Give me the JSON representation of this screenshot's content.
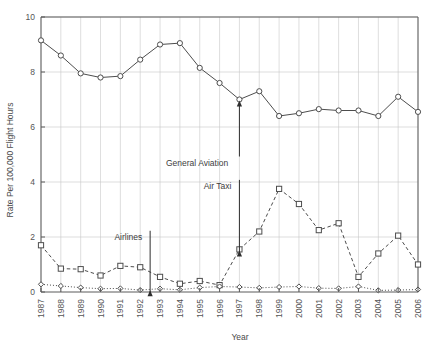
{
  "chart_data": {
    "type": "line",
    "title": "",
    "xlabel": "Year",
    "ylabel": "Rate Per 100,000 Flight Hours",
    "x": [
      1987,
      1988,
      1989,
      1990,
      1991,
      1992,
      1993,
      1994,
      1995,
      1996,
      1997,
      1998,
      1999,
      2000,
      2001,
      2002,
      2003,
      2004,
      2005,
      2006
    ],
    "categories": [
      "1987",
      "1988",
      "1989",
      "1990",
      "1991",
      "1992",
      "1993",
      "1994",
      "1995",
      "1996",
      "1997",
      "1998",
      "1999",
      "2000",
      "2001",
      "2002",
      "2003",
      "2004",
      "2005",
      "2006"
    ],
    "xlim": [
      1987,
      2006
    ],
    "ylim": [
      0,
      10
    ],
    "yticks": [
      0,
      2,
      4,
      6,
      8,
      10
    ],
    "ytick_labels": [
      "0",
      "2",
      "4",
      "6",
      "8",
      "10"
    ],
    "grid": true,
    "legend": "none",
    "series": [
      {
        "name": "General Aviation",
        "marker": "circle",
        "linestyle": "solid",
        "color": "#4d4d4d",
        "values": [
          9.15,
          8.6,
          7.95,
          7.8,
          7.85,
          8.45,
          9.0,
          9.05,
          8.15,
          7.6,
          7.0,
          7.3,
          6.4,
          6.5,
          6.65,
          6.6,
          6.6,
          6.4,
          7.1,
          6.55
        ]
      },
      {
        "name": "Air Taxi",
        "marker": "square",
        "linestyle": "dashed",
        "color": "#4d4d4d",
        "values": [
          1.7,
          0.85,
          0.83,
          0.6,
          0.95,
          0.9,
          0.55,
          0.3,
          0.4,
          0.25,
          1.55,
          2.2,
          3.75,
          3.2,
          2.25,
          2.5,
          0.55,
          1.4,
          2.05,
          1.0
        ]
      },
      {
        "name": "Airlines",
        "marker": "diamond",
        "linestyle": "dotted",
        "color": "#4d4d4d",
        "values": [
          0.28,
          0.22,
          0.16,
          0.12,
          0.13,
          0.07,
          0.12,
          0.08,
          0.16,
          0.2,
          0.18,
          0.15,
          0.18,
          0.2,
          0.14,
          0.13,
          0.2,
          0.06,
          0.07,
          0.09
        ]
      }
    ],
    "annotations": [
      {
        "label": "General Aviation",
        "target_x": 1997,
        "target_y": 7.0,
        "text_x": 1993.3,
        "text_y": 4.6
      },
      {
        "label": "Air Taxi",
        "target_x": 1997,
        "target_y": 1.55,
        "text_x": 1995.2,
        "text_y": 3.75
      },
      {
        "label": "Airlines",
        "target_x": 1992.5,
        "target_y": 0.1,
        "text_x": 1990.7,
        "text_y": 1.9
      }
    ]
  },
  "axes": {
    "y_title": "Rate Per 100,000 Flight Hours",
    "x_title": "Year"
  },
  "colors": {
    "line": "#4d4d4d",
    "grid": "#c8c8c8",
    "axis": "#5a5a5a",
    "text": "#4a4a4a",
    "background": "#ffffff"
  }
}
